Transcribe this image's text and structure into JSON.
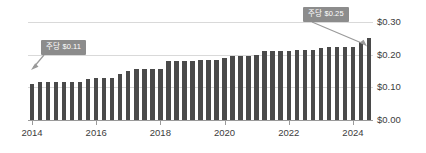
{
  "chart_data": {
    "type": "bar",
    "title": "",
    "xlabel": "",
    "ylabel": "",
    "ylim": [
      0,
      0.3
    ],
    "grid": true,
    "legend": "none",
    "y_ticks": [
      "$0.00",
      "$0.10",
      "$0.20",
      "$0.30"
    ],
    "y_tick_values": [
      0.0,
      0.1,
      0.2,
      0.3
    ],
    "x_ticks": [
      "2014",
      "2016",
      "2018",
      "2020",
      "2022",
      "2024"
    ],
    "x_tick_values": [
      2014,
      2016,
      2018,
      2020,
      2022,
      2024
    ],
    "categories": [
      "2014 Q1",
      "2014 Q2",
      "2014 Q3",
      "2014 Q4",
      "2015 Q1",
      "2015 Q2",
      "2015 Q3",
      "2015 Q4",
      "2016 Q1",
      "2016 Q2",
      "2016 Q3",
      "2016 Q4",
      "2017 Q1",
      "2017 Q2",
      "2017 Q3",
      "2017 Q4",
      "2018 Q1",
      "2018 Q2",
      "2018 Q3",
      "2018 Q4",
      "2019 Q1",
      "2019 Q2",
      "2019 Q3",
      "2019 Q4",
      "2020 Q1",
      "2020 Q2",
      "2020 Q3",
      "2020 Q4",
      "2021 Q1",
      "2021 Q2",
      "2021 Q3",
      "2021 Q4",
      "2022 Q1",
      "2022 Q2",
      "2022 Q3",
      "2022 Q4",
      "2023 Q1",
      "2023 Q2",
      "2023 Q3",
      "2023 Q4",
      "2024 Q1",
      "2024 Q2",
      "2024 Q3"
    ],
    "values": [
      0.11,
      0.115,
      0.115,
      0.115,
      0.117,
      0.117,
      0.117,
      0.125,
      0.13,
      0.13,
      0.13,
      0.14,
      0.15,
      0.155,
      0.155,
      0.155,
      0.155,
      0.18,
      0.18,
      0.18,
      0.18,
      0.185,
      0.185,
      0.185,
      0.19,
      0.195,
      0.195,
      0.195,
      0.2,
      0.21,
      0.21,
      0.21,
      0.21,
      0.215,
      0.215,
      0.215,
      0.22,
      0.225,
      0.225,
      0.225,
      0.225,
      0.24,
      0.25
    ],
    "bar_color": "#4a4a4a",
    "gridline_color": "#d9d9d9",
    "annotations": [
      {
        "label": "주당 $0.11",
        "target_category": "2014 Q1",
        "target_value": 0.11
      },
      {
        "label": "주당 $0.25",
        "target_category": "2024 Q3",
        "target_value": 0.25
      }
    ]
  },
  "callouts": {
    "left": {
      "text": "주당 $0.11"
    },
    "right": {
      "text": "주당 $0.25"
    }
  }
}
